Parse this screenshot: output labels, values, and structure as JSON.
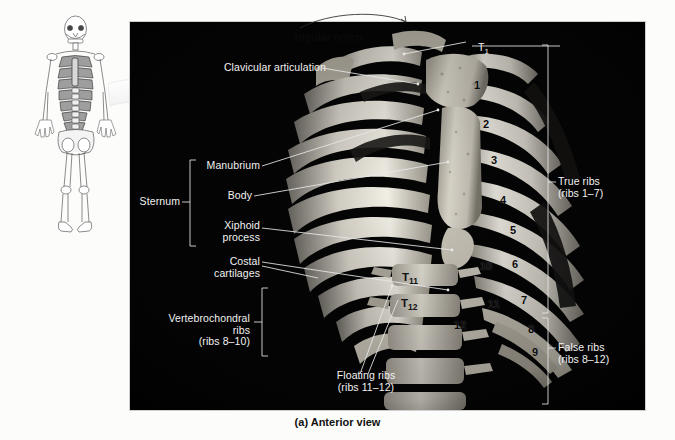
{
  "figure": {
    "caption": "(a) Anterior view",
    "panel_background": "#040404",
    "label_color": "#f2f2f2"
  },
  "inset": {
    "name": "whole-body-skeleton-anterior",
    "highlight_region": "thoracic-cage"
  },
  "labels_left": [
    {
      "id": "clavicular-articulation",
      "text": "Clavicular articulation"
    },
    {
      "id": "manubrium",
      "text": "Manubrium"
    },
    {
      "id": "body",
      "text": "Body"
    },
    {
      "id": "xiphoid-process",
      "text": "Xiphoid\nprocess"
    },
    {
      "id": "costal-cartilages",
      "text": "Costal\ncartilages"
    },
    {
      "id": "sternum",
      "text": "Sternum"
    },
    {
      "id": "vertebrochondral-ribs",
      "text": "Vertebrochondral\nribs\n(ribs 8–10)"
    }
  ],
  "labels_top": [
    {
      "id": "jugular-notch",
      "text": "Jugular notch"
    },
    {
      "id": "t1-vertebra",
      "text": "T",
      "sub": "1"
    }
  ],
  "labels_bottom": [
    {
      "id": "floating-ribs",
      "text": "Floating ribs\n(ribs 11–12)"
    }
  ],
  "labels_right": [
    {
      "id": "true-ribs",
      "text": "True ribs\n(ribs 1–7)"
    },
    {
      "id": "false-ribs",
      "text": "False ribs\n(ribs 8–12)"
    }
  ],
  "rib_numbers": [
    {
      "n": "1",
      "x": 474,
      "y": 85
    },
    {
      "n": "2",
      "x": 483,
      "y": 124
    },
    {
      "n": "3",
      "x": 491,
      "y": 160
    },
    {
      "n": "4",
      "x": 500,
      "y": 200
    },
    {
      "n": "5",
      "x": 510,
      "y": 230
    },
    {
      "n": "6",
      "x": 512,
      "y": 264
    },
    {
      "n": "7",
      "x": 521,
      "y": 300
    },
    {
      "n": "8",
      "x": 528,
      "y": 329
    },
    {
      "n": "9",
      "x": 532,
      "y": 352
    },
    {
      "n": "10",
      "x": 484,
      "y": 266
    },
    {
      "n": "11",
      "x": 492,
      "y": 304
    },
    {
      "n": "12",
      "x": 458,
      "y": 325
    }
  ],
  "vertebra_numbers": [
    {
      "label": "T",
      "sub": "11",
      "x": 405,
      "y": 278
    },
    {
      "label": "T",
      "sub": "12",
      "x": 404,
      "y": 304
    }
  ]
}
